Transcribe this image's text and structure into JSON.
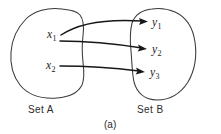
{
  "figure": {
    "caption": "(a)",
    "background_color": "#ffffff",
    "ink_color": "#1a1a1a",
    "blob_stroke_color": "#3a3a3a"
  },
  "sets": [
    {
      "name": "set-a",
      "label": "Set A",
      "label_x": 28,
      "label_y": 113,
      "elements": [
        {
          "base": "x",
          "sub": "1",
          "x": 47,
          "y": 38
        },
        {
          "base": "x",
          "sub": "2",
          "x": 46,
          "y": 69
        }
      ]
    },
    {
      "name": "set-b",
      "label": "Set B",
      "label_x": 137,
      "label_y": 113,
      "elements": [
        {
          "base": "y",
          "sub": "1",
          "x": 152,
          "y": 26
        },
        {
          "base": "y",
          "sub": "2",
          "x": 152,
          "y": 53
        },
        {
          "base": "y",
          "sub": "3",
          "x": 150,
          "y": 76
        }
      ]
    }
  ],
  "mappings": [
    {
      "name": "arrow-x1-to-y1",
      "from": "x1",
      "to": "y1"
    },
    {
      "name": "arrow-x1-to-y2",
      "from": "x1",
      "to": "y2"
    },
    {
      "name": "arrow-x2-to-y3",
      "from": "x2",
      "to": "y3"
    }
  ],
  "caption": {
    "text": "(a)",
    "x": 104,
    "y": 128
  }
}
